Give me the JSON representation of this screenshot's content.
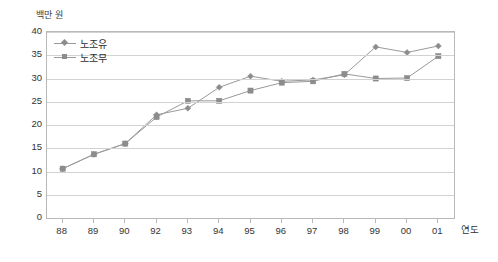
{
  "chart_data": {
    "type": "line",
    "title": "",
    "xlabel": "연도",
    "ylabel": "백만 원",
    "ylim": [
      0,
      40
    ],
    "ytick_step": 5,
    "grid": true,
    "legend_position": "top-left inside plot",
    "categories": [
      "88",
      "89",
      "90",
      "92",
      "93",
      "94",
      "95",
      "96",
      "97",
      "98",
      "99",
      "00",
      "01"
    ],
    "yticks": [
      "0",
      "5",
      "10",
      "15",
      "20",
      "25",
      "30",
      "35",
      "40"
    ],
    "series": [
      {
        "name": "노조유",
        "marker": "diamond",
        "color": "#8c8c8c",
        "values": [
          10.6,
          13.7,
          16.0,
          22.2,
          23.6,
          28.1,
          30.5,
          29.4,
          29.7,
          30.8,
          36.8,
          35.6,
          37.0
        ]
      },
      {
        "name": "노조무",
        "marker": "square",
        "color": "#8c8c8c",
        "values": [
          10.6,
          13.7,
          16.0,
          21.7,
          25.2,
          25.2,
          27.4,
          29.1,
          29.4,
          31.0,
          30.0,
          30.1,
          34.8
        ]
      }
    ]
  },
  "colors": {
    "line": "#9a9a9a",
    "marker": "#8c8c8c",
    "grid": "#d2d2d2",
    "axis": "#b9b9b9",
    "text": "#333333",
    "background": "#ffffff"
  }
}
